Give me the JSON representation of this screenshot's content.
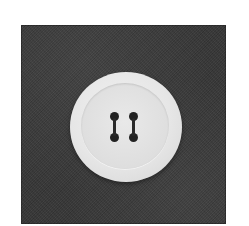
{
  "image": {
    "description": "Photograph of a white four-hole button on dark textured fabric",
    "subject": "button",
    "background": "dark gray fabric",
    "colors": {
      "fabric": "#383838",
      "button": "#e6e6e6",
      "holes": "#222222",
      "page_background": "#ffffff"
    },
    "holes_count": 4
  }
}
